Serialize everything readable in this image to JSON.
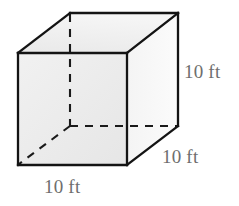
{
  "figure": {
    "name": "cube-diagram",
    "shape": "cube",
    "background_color": "#ffffff"
  },
  "labels": {
    "height": "10 ft",
    "depth": "10 ft",
    "width": "10 ft",
    "color": "#6e6e6e"
  },
  "geometry": {
    "front_face": {
      "top_left": [
        18,
        53
      ],
      "top_right": [
        127,
        53
      ],
      "bottom_right": [
        127,
        165
      ],
      "bottom_left": [
        18,
        165
      ]
    },
    "back_face": {
      "top_left": [
        70,
        13
      ],
      "top_right": [
        178,
        13
      ],
      "bottom_right": [
        178,
        126
      ],
      "bottom_left": [
        70,
        126
      ]
    },
    "edge_color": "#1a1a1a",
    "edge_width": 2,
    "dash_pattern": "8 7",
    "face_fill_front": "#ededed",
    "face_fill_top": "#f2f2f2",
    "face_fill_right": "#fafafa"
  }
}
